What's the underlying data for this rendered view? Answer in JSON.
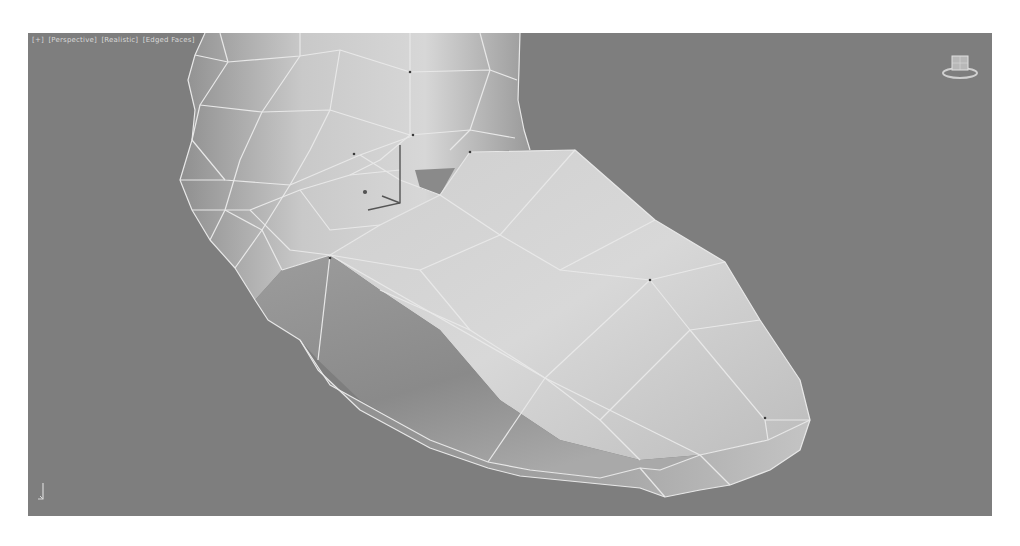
{
  "viewport": {
    "labels": [
      "[+]",
      "[Perspective]",
      "[Realistic]",
      "[Edged Faces]"
    ],
    "background_color": "#7e7e7e",
    "wire_color": "#e6e6e6",
    "object": "boot mesh (low-poly, edged faces)"
  },
  "icons": {
    "viewcube": "viewcube-icon",
    "gizmo": "transform-gizmo-icon",
    "axis": "world-axis-tripod-icon"
  }
}
